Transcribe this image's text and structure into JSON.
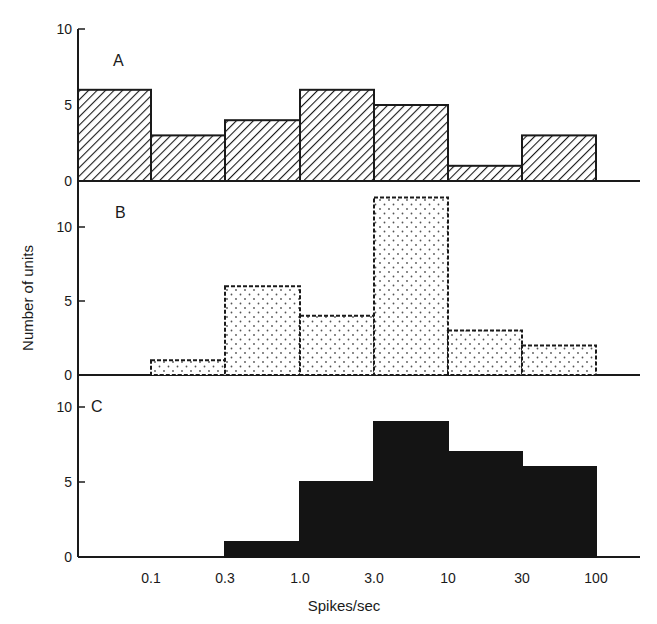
{
  "chart_data": {
    "type": "bar",
    "subtype": "histogram",
    "xlabel": "Spikes/sec",
    "ylabel": "Number of units",
    "x_scale": "log",
    "bin_edges": [
      0.05,
      0.1,
      0.3,
      1.0,
      3.0,
      10,
      30,
      100
    ],
    "x_tick_labels": [
      "0.1",
      "0.3",
      "1.0",
      "3.0",
      "10",
      "30",
      "100"
    ],
    "panels": [
      {
        "label": "A",
        "fill": "diagonal-hatch",
        "y_ticks": [
          "0",
          "5",
          "10"
        ],
        "ylim": [
          0,
          10
        ],
        "values": [
          6,
          3,
          4,
          6,
          5,
          1,
          3
        ]
      },
      {
        "label": "B",
        "fill": "stipple-dots",
        "y_ticks": [
          "0",
          "5",
          "10"
        ],
        "ylim": [
          0,
          12
        ],
        "values": [
          0,
          1,
          6,
          4,
          12,
          3,
          2
        ]
      },
      {
        "label": "C",
        "fill": "solid-black",
        "y_ticks": [
          "0",
          "5",
          "10"
        ],
        "ylim": [
          0,
          10
        ],
        "values": [
          0,
          0,
          1,
          5,
          9,
          7,
          6
        ]
      }
    ],
    "grid": false,
    "legend": null
  },
  "labels": {
    "panel_a": "A",
    "panel_b": "B",
    "panel_c": "C",
    "ylabel": "Number of units",
    "xlabel": "Spikes/sec",
    "y_tick_0": "0",
    "y_tick_5": "5",
    "y_tick_10": "10",
    "x_ticks": [
      "0.1",
      "0.3",
      "1.0",
      "3.0",
      "10",
      "30",
      "100"
    ]
  },
  "colors": {
    "ink": "#1a1a1a",
    "background": "#ffffff"
  }
}
